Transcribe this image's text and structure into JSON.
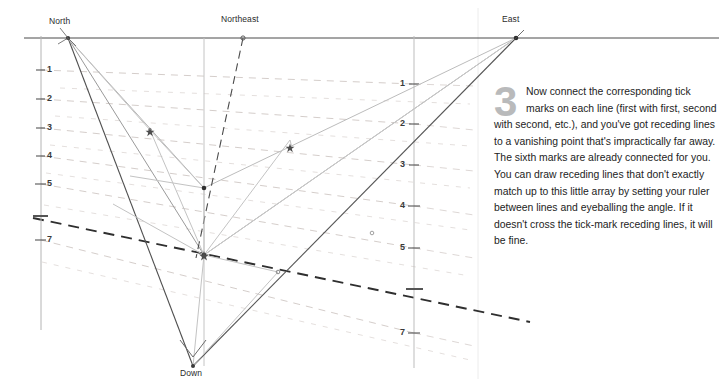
{
  "figure": {
    "title_vertices": [
      {
        "name": "north",
        "label": "North",
        "x": 68,
        "y": 38,
        "label_x": 49,
        "label_y": 16
      },
      {
        "name": "northeast",
        "label": "Northeast",
        "x": 243,
        "y": 38,
        "label_x": 221,
        "label_y": 14
      },
      {
        "name": "east",
        "label": "East",
        "x": 516,
        "y": 38,
        "label_x": 502,
        "label_y": 14
      },
      {
        "name": "down",
        "label": "Down",
        "x": 193,
        "y": 367,
        "label_x": 182,
        "label_y": 368
      }
    ],
    "left_axis": {
      "x": 41,
      "ticks": [
        {
          "label": "1",
          "y": 70
        },
        {
          "label": "2",
          "y": 99
        },
        {
          "label": "3",
          "y": 128
        },
        {
          "label": "4",
          "y": 156
        },
        {
          "label": "5",
          "y": 184
        },
        {
          "label": "",
          "y": 216
        },
        {
          "label": "7",
          "y": 240
        }
      ]
    },
    "right_axis": {
      "x": 414,
      "ticks": [
        {
          "label": "1",
          "y": 84
        },
        {
          "label": "2",
          "y": 124
        },
        {
          "label": "3",
          "y": 165
        },
        {
          "label": "4",
          "y": 206
        },
        {
          "label": "5",
          "y": 248
        },
        {
          "label": "",
          "y": 289
        },
        {
          "label": "7",
          "y": 333
        }
      ]
    },
    "colors": {
      "ink_dark": "#3a3a3a",
      "ink_mid": "#6f6f6f",
      "ink_light": "#b0b0b0",
      "ink_faint": "#d2d2d2",
      "pencil_warm": "#c9bcb8",
      "divider": "#e6e6e6",
      "numeral_gray": "#b9babb"
    }
  },
  "caption": {
    "step_number": "3",
    "body": "Now connect the corresponding tick marks on each line (first with first, second with second, etc.), and you've got receding lines to a vanishing point that's impractically far away. The sixth marks are already connected for you. You can draw receding lines that don't exactly match up to this little array by setting your ruler between lines and eyeballing the angle. If it doesn't cross the tick-mark receding lines, it will be fine."
  }
}
